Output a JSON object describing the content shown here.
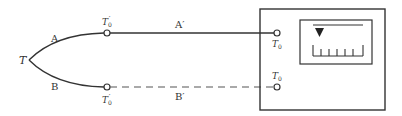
{
  "diagram": {
    "type": "thermocouple-with-compensating-leads",
    "colors": {
      "line": "#333333",
      "dashed_line": "#555555",
      "background": "#ffffff"
    },
    "hot_junction": {
      "label": "T"
    },
    "thermocouple_wires": [
      {
        "id": "A",
        "label": "A"
      },
      {
        "id": "B",
        "label": "B"
      }
    ],
    "reference_junctions": [
      {
        "position": "top",
        "label_main": "T",
        "label_sub": "0",
        "label_prime": "′"
      },
      {
        "position": "bottom",
        "label_main": "T",
        "label_sub": "0",
        "label_prime": "′"
      }
    ],
    "extension_wires": [
      {
        "id": "A'",
        "label": "A′",
        "style": "solid"
      },
      {
        "id": "B'",
        "label": "B′",
        "style": "dashed"
      }
    ],
    "instrument": {
      "terminals": [
        {
          "position": "top",
          "label_main": "T",
          "label_sub": "0"
        },
        {
          "position": "bottom",
          "label_main": "T",
          "label_sub": "0"
        }
      ],
      "meter": {
        "pointer": "▼",
        "scale_ticks": 7
      }
    }
  }
}
